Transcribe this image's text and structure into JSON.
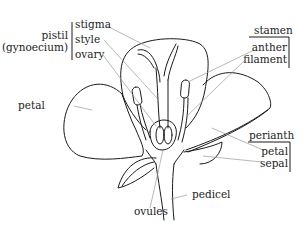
{
  "diagram": {
    "groups": {
      "pistil": {
        "label_line1": "pistil",
        "label_line2": "(gynoecium)",
        "parts": [
          "stigma",
          "style",
          "ovary"
        ]
      },
      "stamen": {
        "label": "stamen",
        "parts": [
          "anther",
          "filament"
        ]
      },
      "perianth": {
        "label": "perianth",
        "parts": [
          "petal",
          "sepal"
        ]
      }
    },
    "standalone_labels": {
      "petal_left": "petal",
      "ovules": "ovules",
      "pedicel": "pedicel"
    },
    "colors": {
      "outline": "#1a1a1a",
      "leader_line": "#9a9a9a",
      "text": "#222222",
      "background": "#ffffff"
    }
  }
}
